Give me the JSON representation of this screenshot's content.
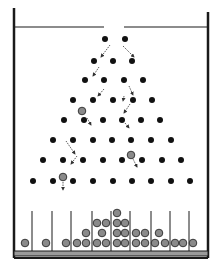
{
  "diagram": {
    "type": "galton-board",
    "colors": {
      "frame": "#1a1a1a",
      "peg": "#111111",
      "ball_fill": "#8a8a8a",
      "ball_stroke": "#2a2a2a",
      "arrow": "#333333",
      "floor_fill": "#9a9a9a"
    },
    "funnel": {
      "y": 27,
      "left": [
        15,
        104
      ],
      "right": [
        124,
        208
      ],
      "gap": [
        104,
        124
      ]
    },
    "walls": {
      "left_x": 14,
      "right_x": 208,
      "top": 8,
      "bottom": 258
    },
    "pegs": [
      [
        [
          105,
          39
        ],
        [
          125,
          39
        ]
      ],
      [
        [
          94,
          61
        ],
        [
          113,
          61
        ],
        [
          132,
          61
        ]
      ],
      [
        [
          85,
          80
        ],
        [
          104,
          80
        ],
        [
          124,
          80
        ],
        [
          143,
          80
        ]
      ],
      [
        [
          73,
          100
        ],
        [
          93,
          100
        ],
        [
          113,
          100
        ],
        [
          133,
          100
        ],
        [
          152,
          100
        ]
      ],
      [
        [
          64,
          120
        ],
        [
          84,
          120
        ],
        [
          103,
          120
        ],
        [
          122,
          120
        ],
        [
          141,
          120
        ],
        [
          160,
          120
        ]
      ],
      [
        [
          53,
          140
        ],
        [
          73,
          140
        ],
        [
          93,
          140
        ],
        [
          112,
          140
        ],
        [
          131,
          140
        ],
        [
          151,
          140
        ],
        [
          171,
          140
        ]
      ],
      [
        [
          43,
          160
        ],
        [
          63,
          160
        ],
        [
          83,
          160
        ],
        [
          103,
          160
        ],
        [
          122,
          160
        ],
        [
          142,
          160
        ],
        [
          162,
          160
        ],
        [
          181,
          160
        ]
      ],
      [
        [
          33,
          181
        ],
        [
          53,
          181
        ],
        [
          73,
          181
        ],
        [
          93,
          181
        ],
        [
          113,
          181
        ],
        [
          132,
          181
        ],
        [
          151,
          181
        ],
        [
          171,
          181
        ],
        [
          190,
          181
        ]
      ]
    ],
    "falling_balls": [
      [
        82,
        111
      ],
      [
        131,
        155
      ],
      [
        63,
        177
      ]
    ],
    "arrows": [
      [
        [
          110,
          45
        ],
        [
          101,
          57
        ]
      ],
      [
        [
          123,
          46
        ],
        [
          134,
          57
        ]
      ],
      [
        [
          99,
          67
        ],
        [
          93,
          76
        ]
      ],
      [
        [
          129,
          86
        ],
        [
          133,
          95
        ]
      ],
      [
        [
          104,
          89
        ],
        [
          98,
          96
        ]
      ],
      [
        [
          124,
          96
        ],
        [
          123,
          101
        ]
      ],
      [
        [
          87,
          118
        ],
        [
          91,
          125
        ]
      ],
      [
        [
          130,
          104
        ],
        [
          124,
          113
        ]
      ],
      [
        [
          125,
          123
        ],
        [
          129,
          128
        ]
      ],
      [
        [
          66,
          141
        ],
        [
          75,
          154
        ]
      ],
      [
        [
          77,
          156
        ],
        [
          71,
          164
        ]
      ],
      [
        [
          132,
          157
        ],
        [
          137,
          167
        ]
      ],
      [
        [
          63,
          182
        ],
        [
          63,
          190
        ]
      ]
    ],
    "bins": {
      "dividers_x": [
        32,
        52,
        71,
        92,
        111,
        130,
        151,
        170,
        189
      ],
      "divider_top": 211,
      "divider_bottom": 251,
      "floor": {
        "y": 251,
        "height": 5
      },
      "balls": [
        [
          25,
          243
        ],
        [
          46,
          243
        ],
        [
          66,
          243
        ],
        [
          77,
          243
        ],
        [
          86,
          243
        ],
        [
          97,
          243
        ],
        [
          106,
          243
        ],
        [
          117,
          243
        ],
        [
          125,
          243
        ],
        [
          136,
          243
        ],
        [
          145,
          243
        ],
        [
          155,
          243
        ],
        [
          165,
          243
        ],
        [
          175,
          243
        ],
        [
          183,
          243
        ],
        [
          193,
          243
        ],
        [
          86,
          233
        ],
        [
          102,
          233
        ],
        [
          117,
          233
        ],
        [
          125,
          233
        ],
        [
          136,
          233
        ],
        [
          145,
          233
        ],
        [
          159,
          233
        ],
        [
          97,
          223
        ],
        [
          106,
          223
        ],
        [
          117,
          223
        ],
        [
          125,
          223
        ],
        [
          117,
          213
        ]
      ],
      "counts_per_bin": [
        1,
        1,
        1,
        4,
        6,
        8,
        4,
        2,
        2,
        1
      ]
    }
  }
}
